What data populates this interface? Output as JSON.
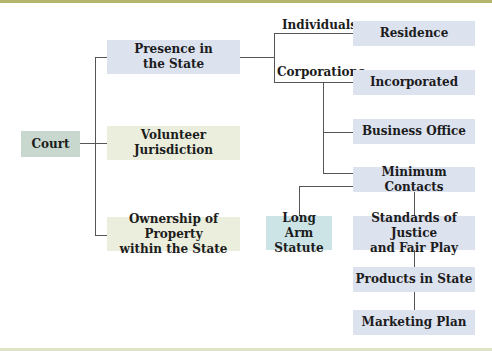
{
  "diagram": {
    "root": {
      "label": "Court",
      "color": "#c8d8ce"
    },
    "branches": [
      {
        "label": "Presence in\nthe State",
        "color": "#dde2ef",
        "sub_labels": [
          {
            "label": "Individuals",
            "children": [
              {
                "label": "Residence",
                "color": "#dde2ef"
              }
            ]
          },
          {
            "label": "Corporations",
            "children": [
              {
                "label": "Incorporated",
                "color": "#dde2ef"
              },
              {
                "label": "Business Office",
                "color": "#dde2ef"
              },
              {
                "label": "Minimum Contacts",
                "color": "#dde2ef",
                "related": {
                  "label": "Long Arm\nStatute",
                  "color": "#cce4e6"
                },
                "chain": [
                  {
                    "label": "Standards of Justice\nand Fair Play",
                    "color": "#dde2ef"
                  },
                  {
                    "label": "Products in State",
                    "color": "#dde2ef"
                  },
                  {
                    "label": "Marketing Plan",
                    "color": "#dde2ef"
                  }
                ]
              }
            ]
          }
        ]
      },
      {
        "label": "Volunteer\nJurisdiction",
        "color": "#ebeedc"
      },
      {
        "label": "Ownership of Property\nwithin the  State",
        "color": "#ebeedc"
      }
    ]
  },
  "style": {
    "top_bar_color": "#b3b56c",
    "bottom_line_color": "#dfe3c6",
    "connector_color": "#555555"
  }
}
